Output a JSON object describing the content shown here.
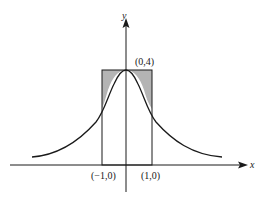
{
  "figure": {
    "axis_labels": {
      "x": "x",
      "y": "y"
    },
    "points": [
      {
        "label": "(0,4)"
      },
      {
        "label": "(−1,0)"
      },
      {
        "label": "(1,0)"
      }
    ],
    "colors": {
      "shade": "#b4b4b4",
      "line": "#1a1a1a"
    }
  }
}
